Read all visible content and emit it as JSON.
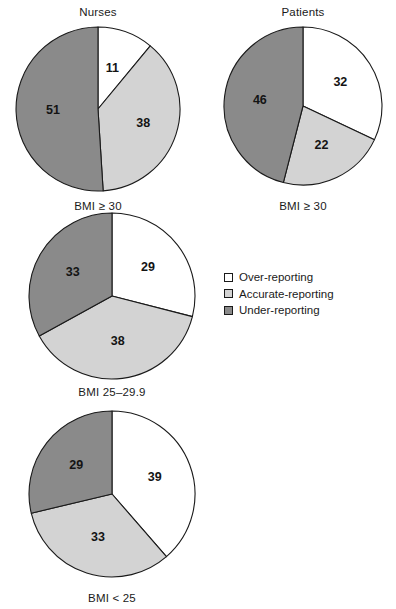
{
  "chart_data": {
    "type": "pie",
    "title": "",
    "legend_position": "right-middle",
    "categories": [
      "Over-reporting",
      "Accurate-reporting",
      "Under-reporting"
    ],
    "colors": {
      "over_reporting": "#ffffff",
      "accurate_reporting": "#d3d3d3",
      "under_reporting": "#8a8a8a",
      "outline": "#1a1a1a"
    },
    "charts": [
      {
        "id": "nurses-bmi-30-plus",
        "title": "Nurses",
        "caption": "BMI ≥ 30",
        "values": [
          11,
          38,
          51
        ],
        "labels": [
          "11",
          "38",
          "51"
        ]
      },
      {
        "id": "patients-bmi-30-plus",
        "title": "Patients",
        "caption": "BMI ≥ 30",
        "values": [
          32,
          22,
          46
        ],
        "labels": [
          "32",
          "22",
          "46"
        ]
      },
      {
        "id": "bmi-25-29-9",
        "title": "",
        "caption": "BMI 25–29.9",
        "values": [
          29,
          38,
          33
        ],
        "labels": [
          "29",
          "38",
          "33"
        ]
      },
      {
        "id": "bmi-under-25",
        "title": "",
        "caption": "BMI < 25",
        "values": [
          39,
          33,
          29
        ],
        "labels": [
          "39",
          "33",
          "29"
        ]
      }
    ],
    "legend": [
      {
        "label": "Over-reporting",
        "color": "#ffffff"
      },
      {
        "label": "Accurate-reporting",
        "color": "#d3d3d3"
      },
      {
        "label": "Under-reporting",
        "color": "#8a8a8a"
      }
    ]
  }
}
